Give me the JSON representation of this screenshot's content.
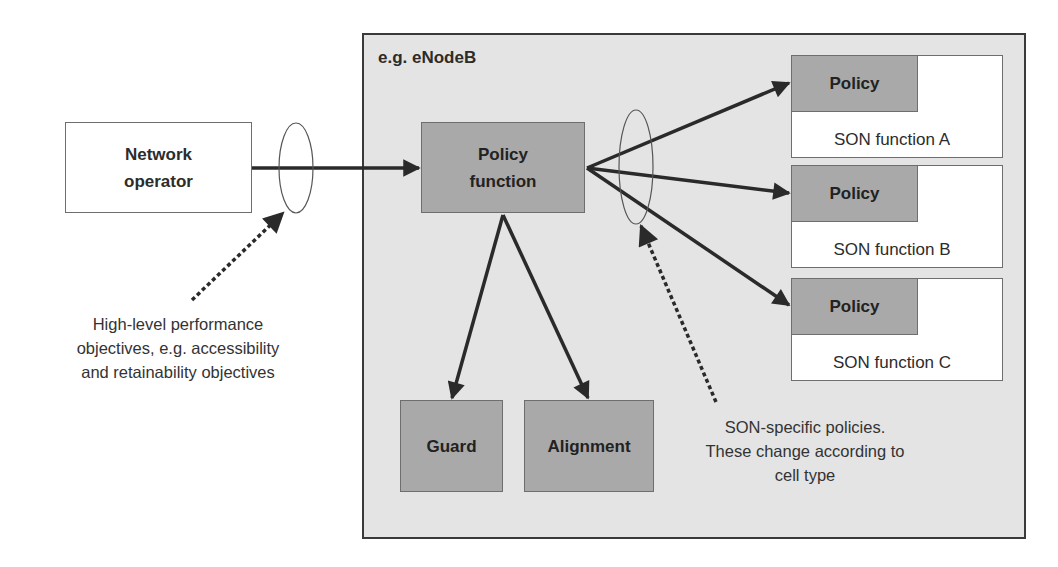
{
  "container": {
    "label": "e.g. eNodeB"
  },
  "network_operator": {
    "line1": "Network",
    "line2": "operator"
  },
  "policy_function": {
    "line1": "Policy",
    "line2": "function"
  },
  "guard": {
    "label": "Guard"
  },
  "alignment": {
    "label": "Alignment"
  },
  "son_functions": [
    {
      "policy_label": "Policy",
      "name": "SON function A"
    },
    {
      "policy_label": "Policy",
      "name": "SON function B"
    },
    {
      "policy_label": "Policy",
      "name": "SON function C"
    }
  ],
  "annotations": {
    "objectives": {
      "line1": "High-level performance",
      "line2": "objectives, e.g. accessibility",
      "line3": "and retainability objectives"
    },
    "son_policies": {
      "line1": "SON-specific policies.",
      "line2": "These change according to",
      "line3": "cell type"
    }
  },
  "colors": {
    "container_fill": "#e4e4e4",
    "dark_box_fill": "#a9a9a9",
    "arrow": "#2a2a2a"
  }
}
